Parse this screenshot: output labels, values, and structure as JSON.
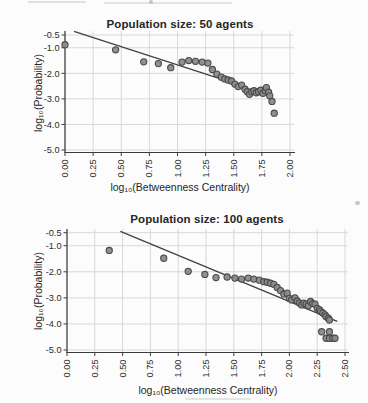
{
  "style": {
    "background": "#fcfcfc",
    "text_color": "#262626",
    "grid_color": "#d8d8d8",
    "axis_color": "#3c3c3c",
    "line_color": "#414141",
    "point_fill": "#8a8a8a",
    "point_stroke": "#4a4a4a"
  },
  "chart_data": [
    {
      "type": "scatter",
      "title": "Population size: 50 agents",
      "xlabel": "log₁₀(Betweenness Centrality)",
      "ylabel": "log₁₀(Probability)",
      "xlim": [
        0.0,
        2.0
      ],
      "ylim": [
        -5.0,
        -0.5
      ],
      "xticks": [
        "0.00",
        "0.25",
        "0.50",
        "0.75",
        "1.00",
        "1.25",
        "1.50",
        "1.75",
        "2.00"
      ],
      "yticks": [
        "-0.5",
        "-1.0",
        "-2.0",
        "-3.0",
        "-4.0",
        "-5.0"
      ],
      "grid": true,
      "tick_label_angle": -90,
      "legend": "none",
      "fit_line": {
        "x1": 0.08,
        "y1": -0.36,
        "x2": 1.5,
        "y2": -2.38
      },
      "points": [
        [
          0.0,
          -0.88
        ],
        [
          0.45,
          -1.08
        ],
        [
          0.7,
          -1.55
        ],
        [
          0.83,
          -1.62
        ],
        [
          0.94,
          -1.78
        ],
        [
          1.04,
          -1.56
        ],
        [
          1.1,
          -1.5
        ],
        [
          1.16,
          -1.53
        ],
        [
          1.22,
          -1.56
        ],
        [
          1.27,
          -1.6
        ],
        [
          1.31,
          -1.85
        ],
        [
          1.35,
          -2.03
        ],
        [
          1.39,
          -2.15
        ],
        [
          1.42,
          -2.22
        ],
        [
          1.45,
          -2.26
        ],
        [
          1.48,
          -2.3
        ],
        [
          1.51,
          -2.42
        ],
        [
          1.54,
          -2.52
        ],
        [
          1.57,
          -2.46
        ],
        [
          1.6,
          -2.62
        ],
        [
          1.62,
          -2.72
        ],
        [
          1.64,
          -2.82
        ],
        [
          1.66,
          -2.72
        ],
        [
          1.68,
          -2.68
        ],
        [
          1.7,
          -2.76
        ],
        [
          1.72,
          -2.72
        ],
        [
          1.74,
          -2.66
        ],
        [
          1.76,
          -2.78
        ],
        [
          1.78,
          -2.68
        ],
        [
          1.79,
          -2.56
        ],
        [
          1.81,
          -2.74
        ],
        [
          1.82,
          -2.88
        ],
        [
          1.84,
          -3.1
        ],
        [
          1.86,
          -3.56
        ]
      ]
    },
    {
      "type": "scatter",
      "title": "Population size: 100 agents",
      "xlabel": "log₁₀(Betweenness Centrality)",
      "ylabel": "log₁₀(Probability)",
      "xlim": [
        0.0,
        2.5
      ],
      "ylim": [
        -5.0,
        -0.5
      ],
      "xticks": [
        "0.00",
        "0.25",
        "0.50",
        "0.75",
        "1.00",
        "1.25",
        "1.50",
        "1.75",
        "2.00",
        "2.25",
        "2.50"
      ],
      "yticks": [
        "-0.5",
        "-1.0",
        "-2.0",
        "-3.0",
        "-4.0",
        "-5.0"
      ],
      "grid": true,
      "tick_label_angle": -90,
      "legend": "none",
      "fit_line": {
        "x1": 0.48,
        "y1": -0.45,
        "x2": 2.43,
        "y2": -3.9
      },
      "points": [
        [
          0.38,
          -1.18
        ],
        [
          0.87,
          -1.48
        ],
        [
          1.09,
          -1.98
        ],
        [
          1.24,
          -2.1
        ],
        [
          1.34,
          -2.22
        ],
        [
          1.44,
          -2.2
        ],
        [
          1.51,
          -2.24
        ],
        [
          1.57,
          -2.28
        ],
        [
          1.63,
          -2.24
        ],
        [
          1.68,
          -2.28
        ],
        [
          1.73,
          -2.32
        ],
        [
          1.77,
          -2.38
        ],
        [
          1.8,
          -2.4
        ],
        [
          1.83,
          -2.44
        ],
        [
          1.86,
          -2.48
        ],
        [
          1.89,
          -2.6
        ],
        [
          1.92,
          -2.72
        ],
        [
          1.95,
          -2.85
        ],
        [
          1.98,
          -2.82
        ],
        [
          2.0,
          -3.02
        ],
        [
          2.02,
          -3.08
        ],
        [
          2.05,
          -3.0
        ],
        [
          2.07,
          -3.12
        ],
        [
          2.09,
          -3.2
        ],
        [
          2.11,
          -3.27
        ],
        [
          2.13,
          -3.2
        ],
        [
          2.15,
          -3.24
        ],
        [
          2.17,
          -3.3
        ],
        [
          2.19,
          -3.14
        ],
        [
          2.21,
          -3.22
        ],
        [
          2.23,
          -3.24
        ],
        [
          2.25,
          -3.4
        ],
        [
          2.27,
          -3.45
        ],
        [
          2.28,
          -3.52
        ],
        [
          2.3,
          -3.58
        ],
        [
          2.32,
          -3.65
        ],
        [
          2.33,
          -3.72
        ],
        [
          2.35,
          -3.78
        ],
        [
          2.36,
          -3.85
        ],
        [
          2.29,
          -4.3
        ],
        [
          2.36,
          -4.3
        ],
        [
          2.33,
          -4.55
        ],
        [
          2.36,
          -4.55
        ],
        [
          2.39,
          -4.55
        ],
        [
          2.41,
          -4.55
        ]
      ]
    }
  ]
}
